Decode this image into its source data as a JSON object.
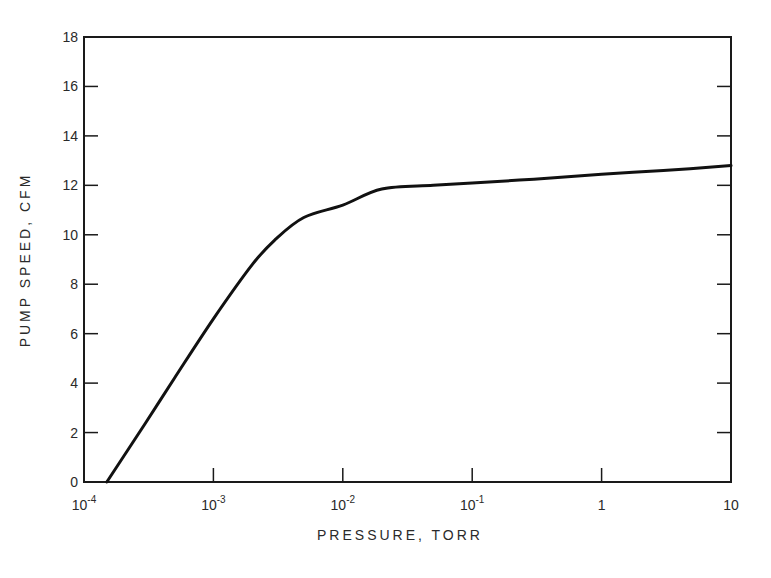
{
  "chart_data": {
    "type": "line",
    "title": "",
    "xlabel": "PRESSURE, TORR",
    "ylabel": "PUMP SPEED, CFM",
    "xscale": "log",
    "xlim": [
      0.0001,
      10
    ],
    "ylim": [
      0,
      18
    ],
    "grid": false,
    "legend": null,
    "x_ticks": [
      {
        "value": 0.0001,
        "base": "10",
        "exp": "-4",
        "label": "10^-4"
      },
      {
        "value": 0.001,
        "base": "10",
        "exp": "-3",
        "label": "10^-3"
      },
      {
        "value": 0.01,
        "base": "10",
        "exp": "-2",
        "label": "10^-2"
      },
      {
        "value": 0.1,
        "base": "10",
        "exp": "-1",
        "label": "10^-1"
      },
      {
        "value": 1,
        "base": "1",
        "exp": "",
        "label": "1"
      },
      {
        "value": 10,
        "base": "10",
        "exp": "",
        "label": "10"
      }
    ],
    "y_ticks": [
      0,
      2,
      4,
      6,
      8,
      10,
      12,
      14,
      16,
      18
    ],
    "y_tick_labels": [
      "0",
      "2",
      "4",
      "6",
      "8",
      "10",
      "12",
      "14",
      "16",
      "18"
    ],
    "series": [
      {
        "name": "Pump speed",
        "x": [
          0.00015,
          0.0003,
          0.0005,
          0.001,
          0.002,
          0.003,
          0.005,
          0.01,
          0.02,
          0.05,
          0.1,
          0.3,
          1,
          3,
          10
        ],
        "y": [
          0,
          2.4,
          4.2,
          6.6,
          8.8,
          9.8,
          10.7,
          11.2,
          11.85,
          12.0,
          12.1,
          12.25,
          12.45,
          12.6,
          12.8
        ]
      }
    ]
  }
}
